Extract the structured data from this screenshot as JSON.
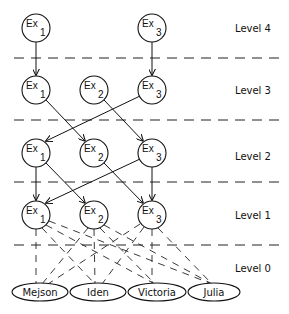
{
  "levels": [
    {
      "label": "Level 4",
      "y": 28
    },
    {
      "label": "Level 3",
      "y": 90
    },
    {
      "label": "Level 2",
      "y": 153
    },
    {
      "label": "Level 1",
      "y": 215
    },
    {
      "label": "Level 0",
      "y": 268
    }
  ],
  "separators_y": [
    58,
    120,
    182,
    245
  ],
  "columns_x": {
    "Ex1": 36,
    "Ex2": 94,
    "Ex3": 152
  },
  "nodes": {
    "l4": [
      {
        "name": "Ex",
        "sub": "1"
      },
      {
        "name": "Ex",
        "sub": "3"
      }
    ],
    "l3": [
      {
        "name": "Ex",
        "sub": "1"
      },
      {
        "name": "Ex",
        "sub": "2"
      },
      {
        "name": "Ex",
        "sub": "3"
      }
    ],
    "l2": [
      {
        "name": "Ex",
        "sub": "1"
      },
      {
        "name": "Ex",
        "sub": "2"
      },
      {
        "name": "Ex",
        "sub": "3"
      }
    ],
    "l1": [
      {
        "name": "Ex",
        "sub": "1"
      },
      {
        "name": "Ex",
        "sub": "2"
      },
      {
        "name": "Ex",
        "sub": "3"
      }
    ]
  },
  "leaves": [
    "Mejson",
    "Iden",
    "Victoria",
    "Julia"
  ],
  "edges": [
    {
      "from": "L4-Ex1",
      "to": "L3-Ex1"
    },
    {
      "from": "L4-Ex3",
      "to": "L3-Ex3"
    },
    {
      "from": "L3-Ex1",
      "to": "L2-Ex2"
    },
    {
      "from": "L3-Ex2",
      "to": "L2-Ex3"
    },
    {
      "from": "L3-Ex3",
      "to": "L2-Ex1"
    },
    {
      "from": "L2-Ex1",
      "to": "L1-Ex1"
    },
    {
      "from": "L2-Ex1",
      "to": "L1-Ex2"
    },
    {
      "from": "L2-Ex2",
      "to": "L1-Ex3"
    },
    {
      "from": "L2-Ex3",
      "to": "L1-Ex3"
    },
    {
      "from": "L2-Ex3",
      "to": "L1-Ex1"
    }
  ],
  "dashed_edges_note": "Each Level 1 node connects with dashed lines to all Level 0 leaves"
}
